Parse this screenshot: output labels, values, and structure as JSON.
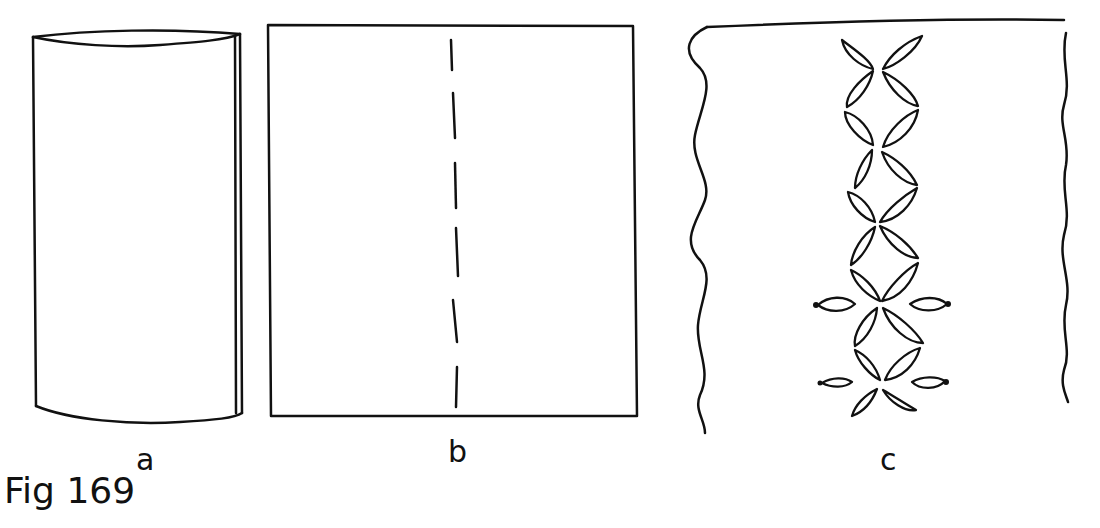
{
  "figure": {
    "caption": "Fig 169",
    "panels": [
      {
        "id": "a",
        "label": "a",
        "description": "Fabric rolled/folded into a tube"
      },
      {
        "id": "b",
        "label": "b",
        "description": "Flat rectangle with dashed center fold line"
      },
      {
        "id": "c",
        "label": "c",
        "description": "Fabric strip with wavy edges and a vertical chain of leaf/petal motifs"
      }
    ],
    "line_color": "#111111",
    "background": "#ffffff"
  }
}
